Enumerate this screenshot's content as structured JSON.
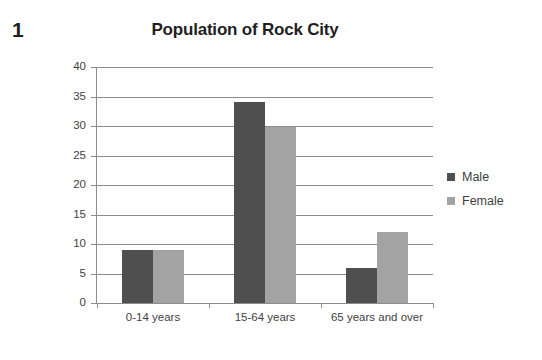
{
  "question_number": "1",
  "chart_data": {
    "type": "bar",
    "title": "Population of Rock City",
    "xlabel": "",
    "ylabel": "Population (%)",
    "ylim": [
      0,
      40
    ],
    "ytick_step": 5,
    "yticks": [
      40,
      35,
      30,
      25,
      20,
      15,
      10,
      5,
      0
    ],
    "grid": true,
    "legend_position": "right",
    "categories": [
      "0-14 years",
      "15-64 years",
      "65 years and over"
    ],
    "series": [
      {
        "name": "Male",
        "color": "#4f4f4f",
        "values": [
          9,
          34,
          6
        ]
      },
      {
        "name": "Female",
        "color": "#a3a3a3",
        "values": [
          9,
          29.8,
          12
        ]
      }
    ]
  },
  "legend": {
    "items": [
      {
        "label": "Male"
      },
      {
        "label": "Female"
      }
    ]
  }
}
